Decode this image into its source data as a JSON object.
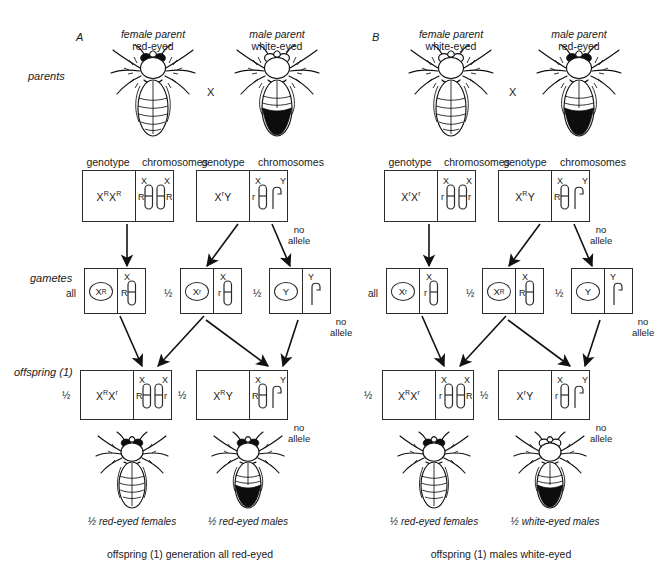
{
  "figure": {
    "type": "genetics-diagram",
    "row_labels": {
      "parents": "parents",
      "gametes": "gametes",
      "offspring": "offspring (1)"
    },
    "column_headers": {
      "genotype": "genotype",
      "chromosomes": "chromosomes"
    },
    "cross_symbol": "X",
    "no_allele_note": {
      "line1": "no",
      "line2": "allele"
    },
    "all_label": "all",
    "half_label": "½",
    "bottom_fade": ""
  },
  "panels": [
    {
      "letter": "A",
      "parents": [
        {
          "role_line1": "female parent",
          "role_line2": "red-eyed",
          "sex": "female",
          "eye": "red"
        },
        {
          "role_line1": "male parent",
          "role_line2": "white-eyed",
          "sex": "male",
          "eye": "white"
        }
      ],
      "parent_boxes": [
        {
          "genotype": "Xᴿ Xᴿ",
          "genotype_parts": [
            {
              "base": "X",
              "sup": "R"
            },
            {
              "base": "X",
              "sup": "R"
            }
          ],
          "chromosomes": [
            {
              "shape": "X",
              "top_label": "X",
              "allele": "R",
              "allele_side": "left"
            },
            {
              "shape": "X",
              "top_label": "X",
              "allele": "R",
              "allele_side": "right"
            }
          ]
        },
        {
          "genotype": "Xʳ Y",
          "genotype_parts": [
            {
              "base": "X",
              "sup": "r"
            },
            {
              "base": "Y",
              "sup": ""
            }
          ],
          "chromosomes": [
            {
              "shape": "X",
              "top_label": "X",
              "allele": "r",
              "allele_side": "left"
            },
            {
              "shape": "Y",
              "top_label": "Y",
              "allele": "",
              "allele_side": "none",
              "note": "no allele"
            }
          ]
        }
      ],
      "gametes": [
        {
          "fraction": "all",
          "genotype": "Xᴿ",
          "base": "X",
          "sup": "R",
          "chromosome": {
            "shape": "X",
            "top_label": "X",
            "allele": "R",
            "allele_side": "left"
          }
        },
        {
          "fraction": "½",
          "genotype": "Xʳ",
          "base": "X",
          "sup": "r",
          "chromosome": {
            "shape": "X",
            "top_label": "X",
            "allele": "r",
            "allele_side": "left"
          }
        },
        {
          "fraction": "½",
          "genotype": "Y",
          "base": "Y",
          "sup": "",
          "chromosome": {
            "shape": "Y",
            "top_label": "Y",
            "allele": "",
            "allele_side": "none",
            "note": "no allele"
          }
        }
      ],
      "offspring": [
        {
          "fraction": "½",
          "genotype": "Xᴿ Xʳ",
          "genotype_parts": [
            {
              "base": "X",
              "sup": "R"
            },
            {
              "base": "X",
              "sup": "r"
            }
          ],
          "chromosomes": [
            {
              "shape": "X",
              "top_label": "X",
              "allele": "R",
              "allele_side": "left"
            },
            {
              "shape": "X",
              "top_label": "X",
              "allele": "r",
              "allele_side": "right"
            }
          ]
        },
        {
          "fraction": "½",
          "genotype": "Xᴿ Y",
          "genotype_parts": [
            {
              "base": "X",
              "sup": "R"
            },
            {
              "base": "Y",
              "sup": ""
            }
          ],
          "chromosomes": [
            {
              "shape": "X",
              "top_label": "X",
              "allele": "R",
              "allele_side": "left"
            },
            {
              "shape": "Y",
              "top_label": "Y",
              "allele": "",
              "allele_side": "none",
              "note": "no allele"
            }
          ]
        }
      ],
      "offspring_flies": [
        {
          "caption": "½ red-eyed females",
          "sex": "female",
          "eye": "red"
        },
        {
          "caption": "½ red-eyed males",
          "sex": "male",
          "eye": "red"
        }
      ],
      "summary": "offspring (1) generation all red-eyed"
    },
    {
      "letter": "B",
      "parents": [
        {
          "role_line1": "female parent",
          "role_line2": "white-eyed",
          "sex": "female",
          "eye": "white"
        },
        {
          "role_line1": "male parent",
          "role_line2": "red-eyed",
          "sex": "male",
          "eye": "red"
        }
      ],
      "parent_boxes": [
        {
          "genotype": "Xʳ Xʳ",
          "genotype_parts": [
            {
              "base": "X",
              "sup": "r"
            },
            {
              "base": "X",
              "sup": "r"
            }
          ],
          "chromosomes": [
            {
              "shape": "X",
              "top_label": "X",
              "allele": "r",
              "allele_side": "left"
            },
            {
              "shape": "X",
              "top_label": "X",
              "allele": "r",
              "allele_side": "right"
            }
          ]
        },
        {
          "genotype": "Xᴿ Y",
          "genotype_parts": [
            {
              "base": "X",
              "sup": "R"
            },
            {
              "base": "Y",
              "sup": ""
            }
          ],
          "chromosomes": [
            {
              "shape": "X",
              "top_label": "X",
              "allele": "R",
              "allele_side": "left"
            },
            {
              "shape": "Y",
              "top_label": "Y",
              "allele": "",
              "allele_side": "none",
              "note": "no allele"
            }
          ]
        }
      ],
      "gametes": [
        {
          "fraction": "all",
          "genotype": "Xʳ",
          "base": "X",
          "sup": "r",
          "chromosome": {
            "shape": "X",
            "top_label": "X",
            "allele": "r",
            "allele_side": "left"
          }
        },
        {
          "fraction": "½",
          "genotype": "Xᴿ",
          "base": "X",
          "sup": "R",
          "chromosome": {
            "shape": "X",
            "top_label": "X",
            "allele": "R",
            "allele_side": "left"
          }
        },
        {
          "fraction": "½",
          "genotype": "Y",
          "base": "Y",
          "sup": "",
          "chromosome": {
            "shape": "Y",
            "top_label": "Y",
            "allele": "",
            "allele_side": "none",
            "note": "no allele"
          }
        }
      ],
      "offspring": [
        {
          "fraction": "½",
          "genotype": "Xᴿ Xʳ",
          "genotype_parts": [
            {
              "base": "X",
              "sup": "R"
            },
            {
              "base": "X",
              "sup": "r"
            }
          ],
          "chromosomes": [
            {
              "shape": "X",
              "top_label": "X",
              "allele": "r",
              "allele_side": "left"
            },
            {
              "shape": "X",
              "top_label": "X",
              "allele": "R",
              "allele_side": "right"
            }
          ]
        },
        {
          "fraction": "½",
          "genotype": "Xʳ Y",
          "genotype_parts": [
            {
              "base": "X",
              "sup": "r"
            },
            {
              "base": "Y",
              "sup": ""
            }
          ],
          "chromosomes": [
            {
              "shape": "X",
              "top_label": "X",
              "allele": "r",
              "allele_side": "left"
            },
            {
              "shape": "Y",
              "top_label": "Y",
              "allele": "",
              "allele_side": "none",
              "note": "no allele"
            }
          ]
        }
      ],
      "offspring_flies": [
        {
          "caption": "½ red-eyed females",
          "sex": "female",
          "eye": "red"
        },
        {
          "caption": "½ white-eyed males",
          "sex": "male",
          "eye": "white"
        }
      ],
      "summary": "offspring (1) males white-eyed"
    }
  ]
}
